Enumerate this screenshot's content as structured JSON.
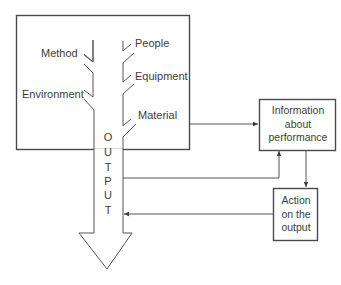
{
  "diagram": {
    "type": "fishbone-feedback-loop",
    "colors": {
      "line": "#4a4a4a",
      "text": "#3c3c3c",
      "background": "#ffffff"
    },
    "causes_left": [
      "Method",
      "Environment"
    ],
    "causes_right": [
      "People",
      "Equipment",
      "Material"
    ],
    "output_letters": [
      "O",
      "U",
      "T",
      "P",
      "U",
      "T"
    ],
    "output_word": "OUTPUT",
    "boxes": {
      "information": {
        "lines": [
          "Information",
          "about",
          "performance"
        ]
      },
      "action": {
        "lines": [
          "Action",
          "on the",
          "output"
        ]
      }
    },
    "connections": [
      {
        "from": "process",
        "to": "information"
      },
      {
        "from": "output",
        "to": "information"
      },
      {
        "from": "information",
        "to": "action"
      },
      {
        "from": "action",
        "to": "output"
      }
    ]
  }
}
